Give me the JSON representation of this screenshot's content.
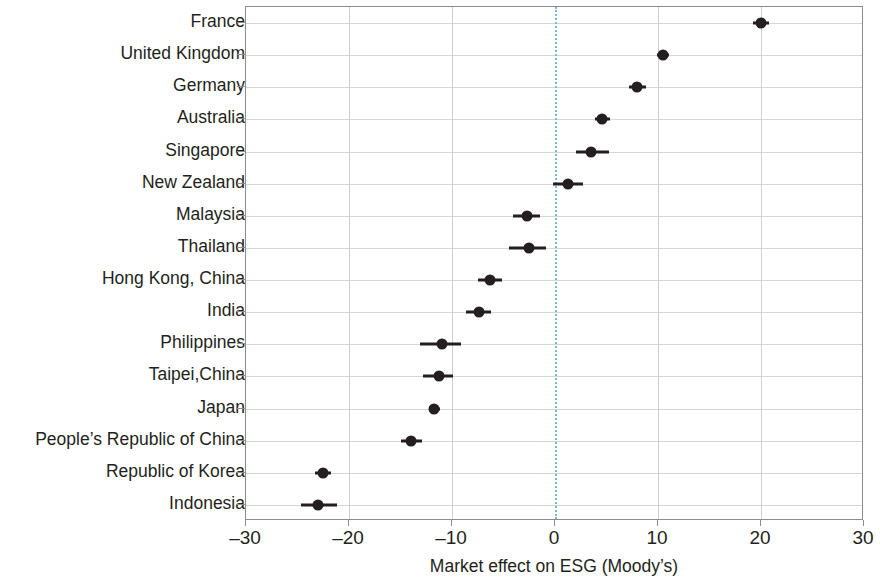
{
  "chart_data": {
    "type": "scatter",
    "title": "",
    "subtitle": "",
    "xlabel": "Market effect on ESG (Moody’s)",
    "ylabel": "",
    "xlim": [
      -30,
      30
    ],
    "xticks": [
      -30,
      -20,
      -10,
      0,
      10,
      20,
      30
    ],
    "xticklabels": [
      "–30",
      "–20",
      "–10",
      "0",
      "10",
      "20",
      "30"
    ],
    "grid": true,
    "legend": false,
    "reference_line": {
      "x": 0,
      "style": "dotted",
      "color": "#7cb6dd"
    },
    "marker_color": "#231f20",
    "grid_color": "#d6d6d6",
    "axis_color": "#8d8d8d",
    "categories": [
      "France",
      "United Kingdom",
      "Germany",
      "Australia",
      "Singapore",
      "New Zealand",
      "Malaysia",
      "Thailand",
      "Hong Kong, China",
      "India",
      "Philippines",
      "Taipei,China",
      "Japan",
      "People’s Republic of China",
      "Republic of Korea",
      "Indonesia"
    ],
    "values": [
      20.0,
      10.5,
      8.0,
      4.6,
      3.5,
      1.3,
      -2.7,
      -2.5,
      -6.3,
      -7.4,
      -11.0,
      -11.3,
      -11.7,
      -14.0,
      -22.5,
      -23.0
    ],
    "ci_low": [
      19.2,
      9.9,
      7.2,
      3.9,
      2.0,
      -0.2,
      -4.1,
      -4.5,
      -7.5,
      -8.6,
      -13.1,
      -12.8,
      -12.2,
      -15.0,
      -23.3,
      -24.7
    ],
    "ci_high": [
      20.8,
      11.1,
      8.8,
      5.3,
      5.2,
      2.7,
      -1.5,
      -0.9,
      -5.1,
      -6.2,
      -9.1,
      -9.9,
      -11.2,
      -12.9,
      -21.7,
      -21.2
    ]
  }
}
